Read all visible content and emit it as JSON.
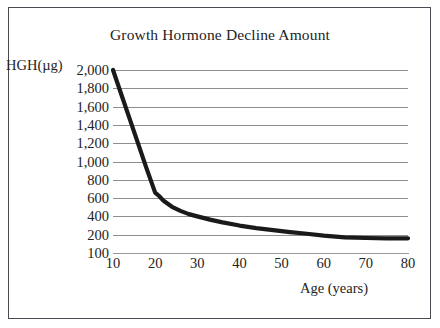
{
  "figure": {
    "title": "Growth Hormone Decline Amount",
    "y_axis_caption": "HGH(µg)",
    "x_axis_caption": "Age (years)",
    "frame_color": "#4a4a52",
    "gridline_color": "#8e8e8e",
    "curve_color": "#1a1a1a",
    "background_color": "#ffffff"
  },
  "chart_data": {
    "type": "line",
    "title": "Growth Hormone Decline Amount",
    "xlabel": "Age (years)",
    "ylabel": "HGH(µg)",
    "xlim": [
      10,
      80
    ],
    "ylim": [
      100,
      2000
    ],
    "grid": true,
    "legend": "none",
    "x_tick_labels": [
      "10",
      "20",
      "30",
      "40",
      "50",
      "60",
      "70",
      "80"
    ],
    "x_ticks": [
      10,
      20,
      30,
      40,
      50,
      60,
      70,
      80
    ],
    "y_tick_labels": [
      "2,000",
      "1,800",
      "1,600",
      "1,400",
      "1,200",
      "1,000",
      "800",
      "600",
      "400",
      "200",
      "100"
    ],
    "y_ticks": [
      2000,
      1800,
      1600,
      1400,
      1200,
      1000,
      800,
      600,
      400,
      200,
      100
    ],
    "series": [
      {
        "name": "HGH decline",
        "x": [
          10,
          12,
          14,
          16,
          18,
          20,
          21,
          22,
          24,
          26,
          28,
          30,
          33,
          36,
          40,
          44,
          48,
          52,
          56,
          60,
          65,
          70,
          75,
          80
        ],
        "values": [
          2000,
          1730,
          1460,
          1190,
          920,
          660,
          620,
          570,
          505,
          460,
          425,
          400,
          365,
          335,
          300,
          272,
          250,
          228,
          210,
          195,
          185,
          182,
          180,
          180
        ]
      }
    ]
  }
}
